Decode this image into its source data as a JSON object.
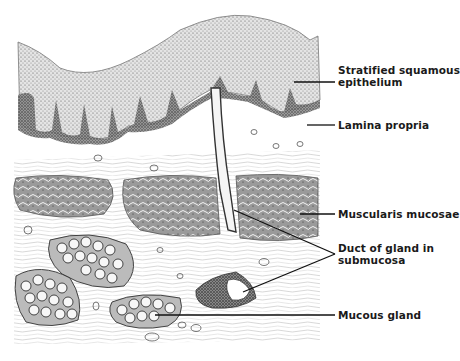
{
  "figure": {
    "labels": [
      {
        "id": "stratified-squamous-epithelium",
        "line1": "Stratified squamous",
        "line2": "epithelium",
        "x": 338,
        "y": 64
      },
      {
        "id": "lamina-propria",
        "line1": "Lamina propria",
        "line2": "",
        "x": 338,
        "y": 120
      },
      {
        "id": "muscularis-mucosae",
        "line1": "Muscularis mucosae",
        "line2": "",
        "x": 338,
        "y": 210
      },
      {
        "id": "duct-of-gland-in-submucosa",
        "line1": "Duct of gland in",
        "line2": "submucosa",
        "x": 338,
        "y": 243
      },
      {
        "id": "mucous-gland",
        "line1": "Mucous gland",
        "line2": "",
        "x": 338,
        "y": 310
      }
    ]
  }
}
